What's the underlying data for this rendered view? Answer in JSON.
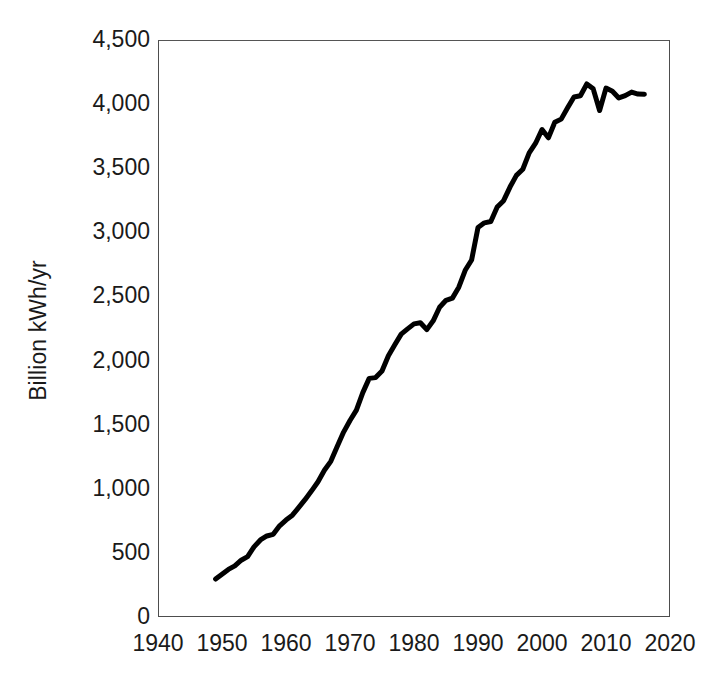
{
  "chart_data": {
    "type": "line",
    "title": "",
    "xlabel": "",
    "ylabel": "Billion kWh/yr",
    "xlim": [
      1940,
      2020
    ],
    "ylim": [
      0,
      4500
    ],
    "grid": false,
    "legend": null,
    "line_color": "#000000",
    "line_width_px": 5,
    "x_ticks": [
      1940,
      1950,
      1960,
      1970,
      1980,
      1990,
      2000,
      2010,
      2020
    ],
    "x_tick_labels": [
      "1940",
      "1950",
      "1960",
      "1970",
      "1980",
      "1990",
      "2000",
      "2010",
      "2020"
    ],
    "y_ticks": [
      0,
      500,
      1000,
      1500,
      2000,
      2500,
      3000,
      3500,
      4000,
      4500
    ],
    "y_tick_labels": [
      "0",
      "500",
      "1,000",
      "1,500",
      "2,000",
      "2,500",
      "3,000",
      "3,500",
      "4,000",
      "4,500"
    ],
    "series": [
      {
        "name": "Electricity generation",
        "x": [
          1949,
          1950,
          1951,
          1952,
          1953,
          1954,
          1955,
          1956,
          1957,
          1958,
          1959,
          1960,
          1961,
          1962,
          1963,
          1964,
          1965,
          1966,
          1967,
          1968,
          1969,
          1970,
          1971,
          1972,
          1973,
          1974,
          1975,
          1976,
          1977,
          1978,
          1979,
          1980,
          1981,
          1982,
          1983,
          1984,
          1985,
          1986,
          1987,
          1988,
          1989,
          1990,
          1991,
          1992,
          1993,
          1994,
          1995,
          1996,
          1997,
          1998,
          1999,
          2000,
          2001,
          2002,
          2003,
          2004,
          2005,
          2006,
          2007,
          2008,
          2009,
          2010,
          2011,
          2012,
          2013,
          2014,
          2015,
          2016
        ],
        "values": [
          296,
          334,
          371,
          399,
          443,
          471,
          547,
          601,
          632,
          645,
          711,
          756,
          794,
          855,
          917,
          984,
          1055,
          1144,
          1214,
          1329,
          1442,
          1532,
          1613,
          1750,
          1861,
          1867,
          1918,
          2038,
          2124,
          2206,
          2247,
          2286,
          2295,
          2241,
          2310,
          2416,
          2470,
          2487,
          2572,
          2704,
          2784,
          3038,
          3074,
          3084,
          3197,
          3247,
          3353,
          3444,
          3492,
          3620,
          3695,
          3802,
          3737,
          3858,
          3883,
          3971,
          4055,
          4065,
          4157,
          4119,
          3950,
          4125,
          4100,
          4048,
          4066,
          4094,
          4078,
          4077
        ],
        "units": "Billion kWh/yr"
      }
    ],
    "annotations": [
      {
        "label": "peak",
        "x": 2007,
        "y": 4157
      },
      {
        "label": "recession-dip",
        "x": 2009,
        "y": 3950
      },
      {
        "label": "series-start",
        "x": 1949,
        "y": 296
      },
      {
        "label": "series-end",
        "x": 2016,
        "y": 4077
      }
    ]
  }
}
